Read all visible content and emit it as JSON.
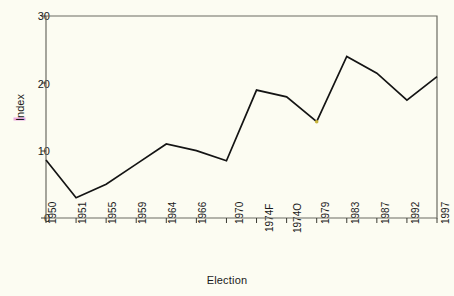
{
  "chart_data": {
    "type": "line",
    "title": "",
    "xlabel": "Election",
    "ylabel": "Index",
    "ylabel_highlight_letter": "I",
    "categories": [
      "1950",
      "1951",
      "1955",
      "1959",
      "1964",
      "1966",
      "1970",
      "1974F",
      "1974O",
      "1979",
      "1983",
      "1987",
      "1992",
      "1997"
    ],
    "values": [
      8.6,
      3.0,
      5.0,
      8.0,
      11.0,
      10.0,
      8.5,
      19.0,
      18.0,
      14.3,
      24.0,
      21.5,
      17.5,
      21.0
    ],
    "ylim": [
      0,
      30
    ],
    "yticks": [
      "0",
      "10",
      "20",
      "30"
    ],
    "ytick_values": [
      0,
      10,
      20,
      30
    ],
    "grid": false,
    "legend": "none",
    "line_color": "#141414",
    "background_color": "#fcfcf2",
    "axis_color": "#6b6b63",
    "marker_1979_color": "#c8b43c"
  },
  "axis": {
    "y_title": "Index",
    "x_title": "Election"
  }
}
